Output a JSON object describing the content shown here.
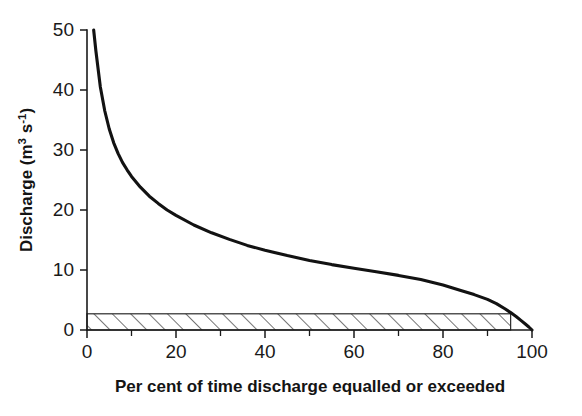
{
  "figure": {
    "kind": "flow-duration-curve",
    "background_color": "#ffffff",
    "curve_color": "#121212",
    "axis_color": "#1a1a1a",
    "hatch_color": "#2a2a2a"
  },
  "axes": {
    "y": {
      "title_main": "Discharge (m",
      "title_sup_1": "3",
      "title_mid": " s",
      "title_sup_2": "-1",
      "title_end": ")",
      "title_plain": "Discharge (m3 s-1)",
      "ticks": [
        "0",
        "10",
        "20",
        "30",
        "40",
        "50"
      ],
      "tick_values": [
        0,
        10,
        20,
        30,
        40,
        50
      ],
      "min": 0,
      "max": 50
    },
    "x": {
      "title": "Per cent of time discharge equalled or exceeded",
      "ticks": [
        "0",
        "20",
        "40",
        "60",
        "80",
        "100"
      ],
      "tick_values": [
        0,
        20,
        40,
        60,
        80,
        100
      ],
      "minor_tick_values": [
        10,
        30,
        50,
        70,
        90
      ],
      "min": 0,
      "max": 100
    }
  },
  "annotations": {
    "hatched_band": {
      "label": "hatched-low-flow-band",
      "y_bottom": 0,
      "y_top": 2.7,
      "x_start": 0,
      "x_end": 95.2
    }
  },
  "chart_data": {
    "type": "line",
    "title": "",
    "xlabel": "Per cent of time discharge equalled or exceeded",
    "ylabel": "Discharge (m3 s-1)",
    "xlim": [
      0,
      100
    ],
    "ylim": [
      0,
      50
    ],
    "grid": false,
    "legend": null,
    "series": [
      {
        "name": "Flow duration curve",
        "color": "#121212",
        "x": [
          1.5,
          2,
          3,
          4,
          5,
          6,
          7,
          8,
          9,
          10,
          12,
          14,
          16,
          18,
          20,
          24,
          28,
          32,
          36,
          40,
          45,
          50,
          55,
          60,
          65,
          70,
          75,
          80,
          84,
          87,
          90,
          92,
          94,
          95.2,
          96.5,
          97.5,
          98.5,
          99.3,
          100
        ],
        "y": [
          50,
          46.5,
          40.5,
          36.5,
          33.5,
          31.2,
          29.4,
          27.9,
          26.7,
          25.6,
          23.8,
          22.3,
          21.1,
          20.0,
          19.1,
          17.5,
          16.2,
          15.1,
          14.1,
          13.3,
          12.4,
          11.6,
          10.9,
          10.3,
          9.7,
          9.1,
          8.4,
          7.5,
          6.6,
          5.9,
          5.1,
          4.4,
          3.5,
          2.9,
          2.2,
          1.6,
          1.0,
          0.5,
          0
        ]
      }
    ],
    "shaded_regions": [
      {
        "name": "hatched-low-flow-band",
        "pattern": "diagonal-hatch",
        "x_range": [
          0,
          95.2
        ],
        "y_range": [
          0,
          2.7
        ]
      }
    ]
  }
}
